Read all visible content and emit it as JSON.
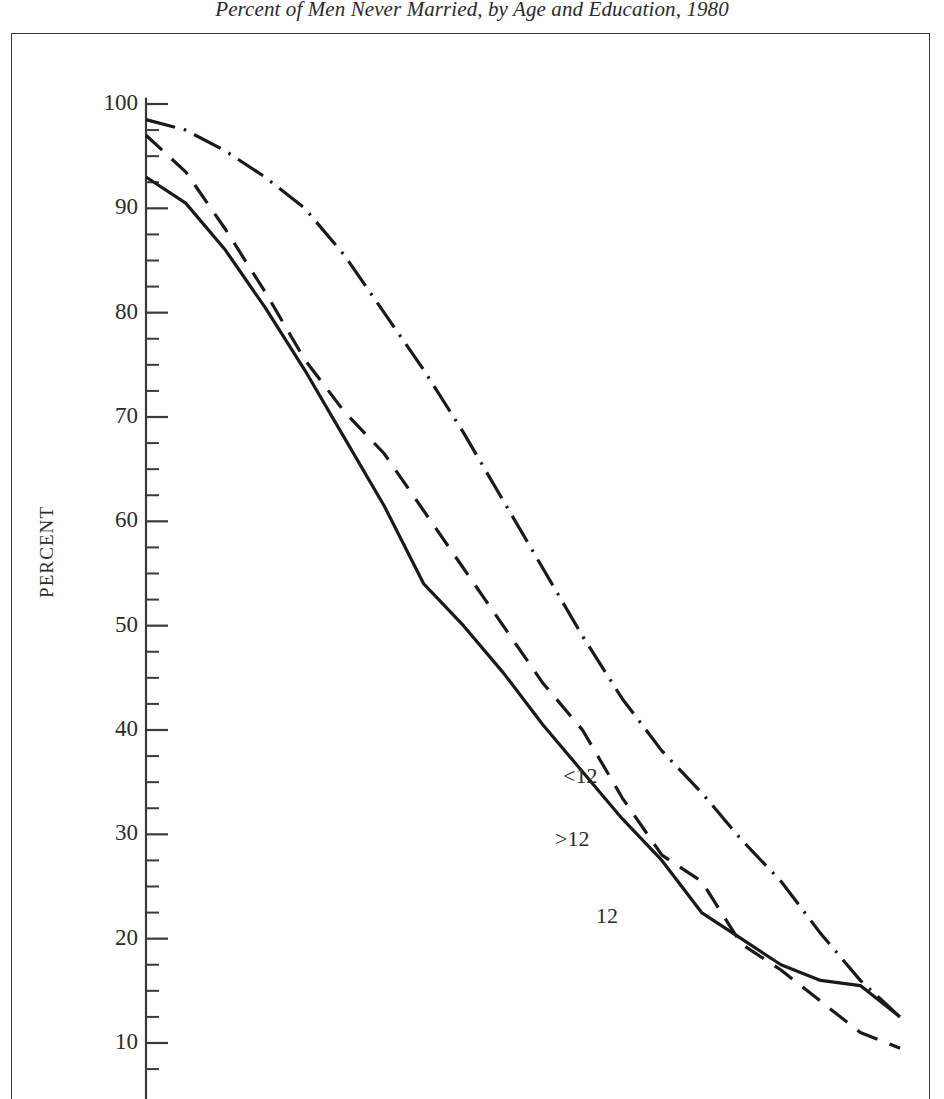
{
  "figure": {
    "title": "Percent of Men Never Married, by Age and Education, 1980",
    "y_axis_label": "PERCENT"
  },
  "axis": {
    "tick_labels": [
      "100",
      "90",
      "80",
      "70",
      "60",
      "50",
      "40",
      "30",
      "20",
      "10"
    ],
    "tick_values": [
      100,
      90,
      80,
      70,
      60,
      50,
      40,
      30,
      20,
      10
    ],
    "minor_tick_step": 2.5
  },
  "series_labels": {
    "lt12": "<12",
    "gt12": ">12",
    "eq12": "12"
  },
  "colors": {
    "line": "#1a1a1a",
    "axis": "#3a3a3a",
    "frame": "#3a3a3a",
    "text": "#2b2b2b",
    "background": "#ffffff"
  },
  "chart_data": {
    "type": "line",
    "title": "Percent of Men Never Married, by Age and Education, 1980",
    "xlabel": "",
    "ylabel": "PERCENT",
    "ylim": [
      6,
      100
    ],
    "xlim": [
      0,
      20
    ],
    "grid": false,
    "legend": "inline-labels",
    "x": [
      0,
      1,
      2,
      3,
      4,
      5,
      6,
      7,
      8,
      9,
      10,
      11,
      12,
      13,
      14,
      15,
      16,
      17,
      18,
      19
    ],
    "series": [
      {
        "name": "<12",
        "label": "<12",
        "style": "dash-dot",
        "values": [
          98.5,
          97.5,
          95.5,
          93.0,
          90.0,
          85.5,
          80.0,
          74.5,
          68.5,
          62.0,
          55.5,
          49.0,
          43.0,
          38.0,
          34.0,
          29.5,
          25.5,
          20.5,
          16.0,
          12.5
        ]
      },
      {
        "name": ">12",
        "label": ">12",
        "style": "solid",
        "values": [
          93.0,
          90.5,
          86.0,
          80.5,
          74.5,
          68.0,
          61.5,
          54.0,
          50.0,
          45.5,
          40.5,
          36.0,
          31.5,
          27.5,
          22.5,
          20.0,
          17.5,
          16.0,
          15.5,
          12.5
        ]
      },
      {
        "name": "12",
        "label": "12",
        "style": "dashed",
        "values": [
          97.0,
          93.5,
          88.0,
          82.0,
          75.5,
          70.5,
          66.5,
          61.0,
          55.5,
          50.0,
          44.5,
          40.0,
          33.5,
          28.0,
          25.5,
          19.5,
          17.0,
          14.0,
          11.0,
          9.5
        ]
      }
    ]
  }
}
